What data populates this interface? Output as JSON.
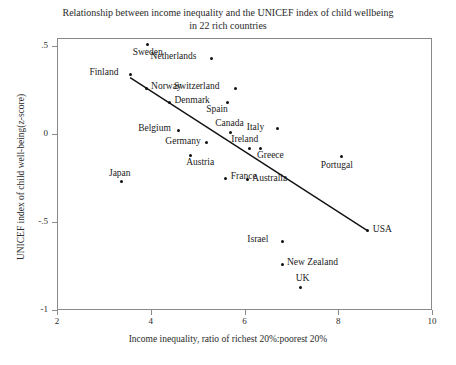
{
  "chart_data": {
    "type": "scatter",
    "title": "Relationship between income inequality and the UNICEF index of child wellbeing in 22 rich countries",
    "title_line1": "Relationship between income inequality and the UNICEF index of child wellbeing",
    "title_line2": "in 22 rich countries",
    "xlabel": "Income inequality, ratio of richest 20%:poorest 20%",
    "ylabel": "UNICEF index of child well-being(z-score)",
    "xlim": [
      2,
      10
    ],
    "ylim": [
      -1,
      0.5
    ],
    "xticks": [
      "2",
      "4",
      "6",
      "8",
      "10"
    ],
    "xtick_values": [
      2,
      4,
      6,
      8,
      10
    ],
    "yticks": [
      ".5",
      "0",
      "-.5",
      "-1"
    ],
    "ytick_values": [
      0.5,
      0,
      -0.5,
      -1
    ],
    "grid": false,
    "legend": "none",
    "point_color": "#111111",
    "trendline": {
      "show": true,
      "color": "#111111",
      "x_start": 3.56,
      "y_start": 0.32,
      "x_end": 8.63,
      "y_end": -0.55
    },
    "points": [
      {
        "name": "Sweden",
        "x": 3.94,
        "y": 0.51,
        "label_pos": "below"
      },
      {
        "name": "Netherlands",
        "x": 5.3,
        "y": 0.43,
        "label_pos": "left"
      },
      {
        "name": "Finland",
        "x": 3.56,
        "y": 0.34,
        "label_pos": "left"
      },
      {
        "name": "Norway",
        "x": 3.9,
        "y": 0.26,
        "label_pos": "right"
      },
      {
        "name": "Switzerland",
        "x": 5.8,
        "y": 0.26,
        "label_pos": "left"
      },
      {
        "name": "Denmark",
        "x": 4.4,
        "y": 0.18,
        "label_pos": "right"
      },
      {
        "name": "Spain",
        "x": 5.64,
        "y": 0.18,
        "label_pos": "below-left"
      },
      {
        "name": "Belgium",
        "x": 4.6,
        "y": 0.02,
        "label_pos": "left"
      },
      {
        "name": "Canada",
        "x": 5.7,
        "y": 0.01,
        "label_pos": "above"
      },
      {
        "name": "Italy",
        "x": 6.7,
        "y": 0.03,
        "label_pos": "left"
      },
      {
        "name": "Germany",
        "x": 5.18,
        "y": -0.05,
        "label_pos": "left"
      },
      {
        "name": "Ireland",
        "x": 6.1,
        "y": -0.08,
        "label_pos": "above"
      },
      {
        "name": "Greece",
        "x": 6.35,
        "y": -0.08,
        "label_pos": "below-right"
      },
      {
        "name": "Austria",
        "x": 4.84,
        "y": -0.12,
        "label_pos": "below-right"
      },
      {
        "name": "Portugal",
        "x": 8.06,
        "y": -0.13,
        "label_pos": "below"
      },
      {
        "name": "France",
        "x": 5.6,
        "y": -0.25,
        "label_pos": "right"
      },
      {
        "name": "Australia",
        "x": 6.06,
        "y": -0.26,
        "label_pos": "right"
      },
      {
        "name": "Japan",
        "x": 3.38,
        "y": -0.27,
        "label_pos": "above"
      },
      {
        "name": "Israel",
        "x": 6.82,
        "y": -0.61,
        "label_pos": "left"
      },
      {
        "name": "USA",
        "x": 8.63,
        "y": -0.55,
        "label_pos": "right"
      },
      {
        "name": "New Zealand",
        "x": 6.8,
        "y": -0.74,
        "label_pos": "right"
      },
      {
        "name": "UK",
        "x": 7.2,
        "y": -0.87,
        "label_pos": "above"
      }
    ]
  }
}
